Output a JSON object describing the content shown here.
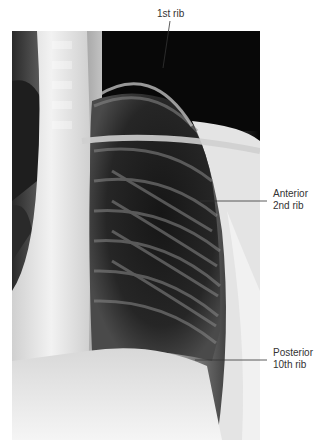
{
  "figure": {
    "type": "chest-radiograph",
    "labels": [
      {
        "id": "first-rib",
        "lines": [
          "1st rib"
        ]
      },
      {
        "id": "anterior-2nd-rib",
        "lines": [
          "Anterior",
          "2nd rib"
        ]
      },
      {
        "id": "posterior-10th-rib",
        "lines": [
          "Posterior",
          "10th rib"
        ]
      }
    ]
  }
}
